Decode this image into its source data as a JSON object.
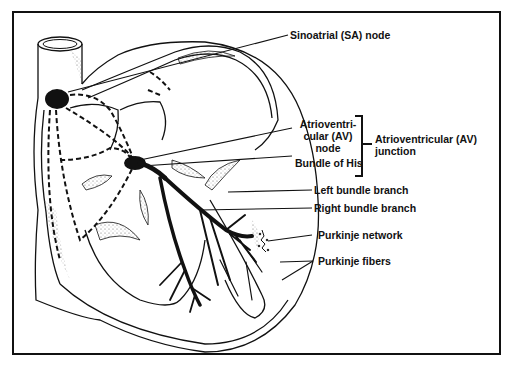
{
  "diagram": {
    "labels": {
      "sa_node": "Sinoatrial (SA) node",
      "av_node_line1": "Atrioventri-",
      "av_node_line2": "cular (AV)",
      "av_node_line3": "node",
      "bundle_of_his": "Bundle of His",
      "av_junction_line1": "Atrioventricular (AV)",
      "av_junction_line2": "junction",
      "left_bundle_branch": "Left bundle branch",
      "right_bundle_branch": "Right bundle branch",
      "purkinje_network": "Purkinje network",
      "purkinje_fibers": "Purkinje fibers"
    },
    "colors": {
      "ink": "#111111",
      "background": "#ffffff",
      "stipple": "#777777"
    }
  }
}
